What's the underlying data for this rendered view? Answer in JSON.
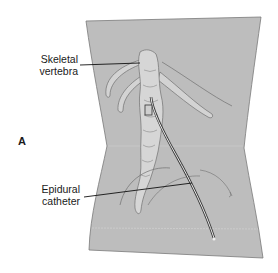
{
  "figure": {
    "panel_letter": "A",
    "labels": {
      "skeletal_vertebra": [
        "Skeletal",
        "vertebra"
      ],
      "epidural_catheter": [
        "Epidural",
        "catheter"
      ]
    },
    "colors": {
      "skin": "#b9b9b9",
      "bone": "#d6d6d6",
      "outline": "#6a6a6a",
      "leader": "#111111"
    }
  }
}
